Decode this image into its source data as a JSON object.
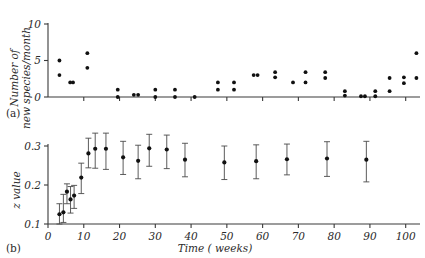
{
  "figure": {
    "panel_a_tag": "(a)",
    "panel_b_tag": "(b)"
  },
  "chart_data": [
    {
      "type": "scatter",
      "panel": "(a)",
      "title": "",
      "xlabel": "",
      "ylabel": "Number of new species/month",
      "ylabel_line1": "Number of",
      "ylabel_line2": "new species/month",
      "xlim": [
        0,
        104
      ],
      "ylim": [
        0,
        10
      ],
      "yticks": [
        0,
        5,
        10
      ],
      "ytick_labels": [
        "0",
        "5",
        "10"
      ],
      "xticks": [
        0,
        10,
        20,
        30,
        40,
        50,
        60,
        70,
        80,
        90,
        100
      ],
      "xtick_labels": [],
      "grid": false,
      "points": [
        {
          "x": 3.2,
          "y": 5
        },
        {
          "x": 3.2,
          "y": 3
        },
        {
          "x": 6.2,
          "y": 2
        },
        {
          "x": 7.0,
          "y": 2
        },
        {
          "x": 11.0,
          "y": 6
        },
        {
          "x": 11.0,
          "y": 4
        },
        {
          "x": 19.5,
          "y": 1
        },
        {
          "x": 19.5,
          "y": 0
        },
        {
          "x": 24.0,
          "y": 0.3
        },
        {
          "x": 25.2,
          "y": 0.3
        },
        {
          "x": 30.0,
          "y": 1
        },
        {
          "x": 30.0,
          "y": 0
        },
        {
          "x": 35.5,
          "y": 1
        },
        {
          "x": 35.5,
          "y": 0
        },
        {
          "x": 41.0,
          "y": 0
        },
        {
          "x": 47.5,
          "y": 2
        },
        {
          "x": 47.5,
          "y": 1
        },
        {
          "x": 52.0,
          "y": 2
        },
        {
          "x": 52.0,
          "y": 1
        },
        {
          "x": 57.5,
          "y": 3
        },
        {
          "x": 58.6,
          "y": 3
        },
        {
          "x": 63.5,
          "y": 3.4
        },
        {
          "x": 63.5,
          "y": 2.7
        },
        {
          "x": 68.5,
          "y": 2
        },
        {
          "x": 72.0,
          "y": 3.4
        },
        {
          "x": 72.0,
          "y": 2
        },
        {
          "x": 77.5,
          "y": 3.4
        },
        {
          "x": 77.5,
          "y": 2.6
        },
        {
          "x": 83.0,
          "y": 0.8
        },
        {
          "x": 83.0,
          "y": 0.2
        },
        {
          "x": 87.5,
          "y": 0.1
        },
        {
          "x": 88.6,
          "y": 0.1
        },
        {
          "x": 91.5,
          "y": 0.8
        },
        {
          "x": 91.5,
          "y": 0.1
        },
        {
          "x": 95.5,
          "y": 2.6
        },
        {
          "x": 95.5,
          "y": 0.8
        },
        {
          "x": 99.5,
          "y": 2.7
        },
        {
          "x": 99.5,
          "y": 1.9
        },
        {
          "x": 103.0,
          "y": 6
        },
        {
          "x": 103.0,
          "y": 2.6
        }
      ]
    },
    {
      "type": "scatter",
      "panel": "(b)",
      "title": "",
      "xlabel": "Time ( weeks)",
      "ylabel": "z value",
      "xlim": [
        0,
        104
      ],
      "ylim": [
        0.1,
        0.34
      ],
      "yticks": [
        0.1,
        0.2,
        0.3
      ],
      "ytick_labels": [
        "0.1",
        "0.2",
        "0.3"
      ],
      "xticks": [
        0,
        10,
        20,
        30,
        40,
        50,
        60,
        70,
        80,
        90,
        100
      ],
      "xtick_labels": [
        "0",
        "10",
        "20",
        "30",
        "40",
        "50",
        "60",
        "70",
        "80",
        "90",
        "100"
      ],
      "grid": false,
      "errorbar": true,
      "points": [
        {
          "x": 3.2,
          "y": 0.125,
          "ylow": 0.1,
          "yhigh": 0.152
        },
        {
          "x": 4.3,
          "y": 0.13,
          "ylow": 0.104,
          "yhigh": 0.176
        },
        {
          "x": 5.3,
          "y": 0.183,
          "ylow": 0.152,
          "yhigh": 0.203
        },
        {
          "x": 6.3,
          "y": 0.163,
          "ylow": 0.128,
          "yhigh": 0.196
        },
        {
          "x": 7.3,
          "y": 0.173,
          "ylow": 0.14,
          "yhigh": 0.199
        },
        {
          "x": 9.3,
          "y": 0.219,
          "ylow": 0.178,
          "yhigh": 0.256
        },
        {
          "x": 11.3,
          "y": 0.281,
          "ylow": 0.244,
          "yhigh": 0.32
        },
        {
          "x": 13.2,
          "y": 0.293,
          "ylow": 0.243,
          "yhigh": 0.333
        },
        {
          "x": 16.2,
          "y": 0.293,
          "ylow": 0.24,
          "yhigh": 0.333
        },
        {
          "x": 21.0,
          "y": 0.271,
          "ylow": 0.227,
          "yhigh": 0.312
        },
        {
          "x": 25.2,
          "y": 0.262,
          "ylow": 0.216,
          "yhigh": 0.302
        },
        {
          "x": 28.3,
          "y": 0.294,
          "ylow": 0.248,
          "yhigh": 0.33
        },
        {
          "x": 33.2,
          "y": 0.291,
          "ylow": 0.242,
          "yhigh": 0.328
        },
        {
          "x": 38.3,
          "y": 0.265,
          "ylow": 0.221,
          "yhigh": 0.307
        },
        {
          "x": 49.3,
          "y": 0.258,
          "ylow": 0.214,
          "yhigh": 0.3
        },
        {
          "x": 58.2,
          "y": 0.261,
          "ylow": 0.216,
          "yhigh": 0.303
        },
        {
          "x": 66.8,
          "y": 0.266,
          "ylow": 0.226,
          "yhigh": 0.305
        },
        {
          "x": 78.0,
          "y": 0.268,
          "ylow": 0.222,
          "yhigh": 0.311
        },
        {
          "x": 89.0,
          "y": 0.265,
          "ylow": 0.208,
          "yhigh": 0.312
        }
      ]
    }
  ]
}
